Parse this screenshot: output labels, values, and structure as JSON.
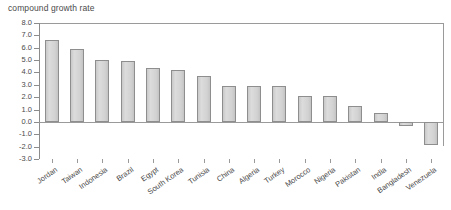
{
  "chart_data": {
    "type": "bar",
    "title": "compound growth rate",
    "xlabel": "",
    "ylabel": "",
    "ylim": [
      -3.0,
      8.0
    ],
    "ytick_step": 1.0,
    "grid": false,
    "legend": null,
    "orientation": "vertical",
    "bar_fill_color": "#d4d4d4",
    "bar_border_color": "#8e8e8e",
    "axis_color": "#9a9a9a",
    "text_color": "#4a4a4a",
    "yticks": [
      "8.0",
      "7.0",
      "6.0",
      "5.0",
      "4.0",
      "3.0",
      "2.0",
      "1.0",
      "0.0",
      "-1.0",
      "-2.0",
      "-3.0"
    ],
    "ytick_values": [
      8.0,
      7.0,
      6.0,
      5.0,
      4.0,
      3.0,
      2.0,
      1.0,
      0.0,
      -1.0,
      -2.0,
      -3.0
    ],
    "categories": [
      "Jordan",
      "Taiwan",
      "Indonesia",
      "Brazil",
      "Egypt",
      "South Korea",
      "Tunisia",
      "China",
      "Algeria",
      "Turkey",
      "Morocco",
      "Nigeria",
      "Pakistan",
      "India",
      "Bangladesh",
      "Venezuela"
    ],
    "values": [
      6.6,
      5.9,
      5.0,
      4.9,
      4.4,
      4.2,
      3.7,
      2.9,
      2.9,
      2.9,
      2.1,
      2.1,
      1.3,
      0.7,
      -0.3,
      -1.9
    ]
  }
}
